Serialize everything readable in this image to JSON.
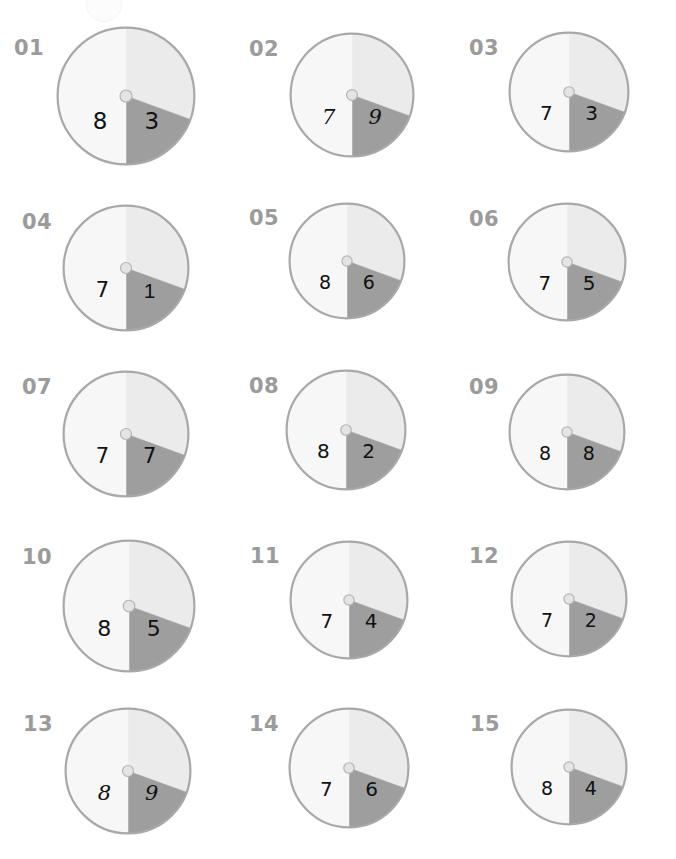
{
  "page": {
    "width": 676,
    "height": 859,
    "background": "#ffffff",
    "columns": 3,
    "rows": 5,
    "chart_count": 15
  },
  "palette": {
    "slice_dark": "#9e9e9e",
    "slice_light": "#ebebeb",
    "slice_white": "#f7f7f7",
    "outline": "#a8a8a8",
    "hub_fill": "#e4e4e4",
    "hub_stroke": "#b4b4b4",
    "index_label": "#9b9b9b",
    "number_label": "#111111"
  },
  "geometry": {
    "note": "Each pie is divided into three wedges by radii at the listed angles, measured in degrees clockwise from 12 o'clock.",
    "boundary_angles_deg": [
      0,
      110,
      180
    ],
    "wedges": [
      {
        "name": "top-light",
        "from_deg": 0,
        "to_deg": 110,
        "fill": "#ebebeb",
        "labeled": false
      },
      {
        "name": "left-dark",
        "from_deg": 110,
        "to_deg": 180,
        "fill": "#9e9e9e",
        "labeled": true
      },
      {
        "name": "right-white",
        "from_deg": 180,
        "to_deg": 360,
        "fill": "#f7f7f7",
        "labeled": true
      }
    ]
  },
  "chart_data": {
    "type": "pie",
    "subtitle": "",
    "xlabel": "",
    "ylabel": "",
    "legend_position": "none",
    "grid": false,
    "series": [
      {
        "name": "left-dark-wedge",
        "values": [
          8,
          7,
          7,
          7,
          8,
          7,
          7,
          8,
          8,
          8,
          7,
          7,
          8,
          7,
          8
        ]
      },
      {
        "name": "right-white-wedge",
        "values": [
          3,
          9,
          3,
          1,
          6,
          5,
          7,
          2,
          8,
          5,
          4,
          2,
          9,
          6,
          4
        ]
      }
    ],
    "categories": [
      "01",
      "02",
      "03",
      "04",
      "05",
      "06",
      "07",
      "08",
      "09",
      "10",
      "11",
      "12",
      "13",
      "14",
      "15"
    ]
  },
  "charts": [
    {
      "index": "01",
      "left": "8",
      "right": "3",
      "left_font": "font-sans",
      "right_font": "font-sans",
      "x": 56,
      "y": 26,
      "size": 140,
      "label_x": 14,
      "label_y": 38,
      "label_size": 21
    },
    {
      "index": "02",
      "left": "7",
      "right": "9",
      "left_font": "font-script",
      "right_font": "font-script",
      "x": 289,
      "y": 32,
      "size": 126,
      "label_x": 249,
      "label_y": 39,
      "label_size": 21
    },
    {
      "index": "03",
      "left": "7",
      "right": "3",
      "left_font": "font-sans",
      "right_font": "font-sans",
      "x": 508,
      "y": 31,
      "size": 122,
      "label_x": 469,
      "label_y": 38,
      "label_size": 21
    },
    {
      "index": "04",
      "left": "7",
      "right": "1",
      "left_font": "font-sans",
      "right_font": "font-narrow",
      "x": 62,
      "y": 204,
      "size": 128,
      "label_x": 22,
      "label_y": 212,
      "label_size": 21
    },
    {
      "index": "05",
      "left": "8",
      "right": "6",
      "left_font": "font-sans",
      "right_font": "font-sans",
      "x": 288,
      "y": 202,
      "size": 118,
      "label_x": 249,
      "label_y": 208,
      "label_size": 21
    },
    {
      "index": "06",
      "left": "7",
      "right": "5",
      "left_font": "font-sans",
      "right_font": "font-sans",
      "x": 507,
      "y": 202,
      "size": 120,
      "label_x": 469,
      "label_y": 209,
      "label_size": 21
    },
    {
      "index": "07",
      "left": "7",
      "right": "7",
      "left_font": "font-sans",
      "right_font": "font-sans",
      "x": 62,
      "y": 370,
      "size": 128,
      "label_x": 22,
      "label_y": 377,
      "label_size": 21
    },
    {
      "index": "08",
      "left": "8",
      "right": "2",
      "left_font": "font-sans",
      "right_font": "font-sans",
      "x": 285,
      "y": 369,
      "size": 122,
      "label_x": 249,
      "label_y": 376,
      "label_size": 21
    },
    {
      "index": "09",
      "left": "8",
      "right": "8",
      "left_font": "font-sans",
      "right_font": "font-sans",
      "x": 508,
      "y": 373,
      "size": 118,
      "label_x": 469,
      "label_y": 377,
      "label_size": 21
    },
    {
      "index": "10",
      "left": "8",
      "right": "5",
      "left_font": "font-sans",
      "right_font": "font-sans",
      "x": 62,
      "y": 539,
      "size": 134,
      "label_x": 22,
      "label_y": 547,
      "label_size": 21
    },
    {
      "index": "11",
      "left": "7",
      "right": "4",
      "left_font": "font-sans",
      "right_font": "font-sans",
      "x": 289,
      "y": 540,
      "size": 120,
      "label_x": 250,
      "label_y": 546,
      "label_size": 21
    },
    {
      "index": "12",
      "left": "7",
      "right": "2",
      "left_font": "font-sans",
      "right_font": "font-sans",
      "x": 510,
      "y": 540,
      "size": 118,
      "label_x": 469,
      "label_y": 546,
      "label_size": 21
    },
    {
      "index": "13",
      "left": "8",
      "right": "9",
      "left_font": "font-script",
      "right_font": "font-script",
      "x": 64,
      "y": 707,
      "size": 128,
      "label_x": 23,
      "label_y": 714,
      "label_size": 21
    },
    {
      "index": "14",
      "left": "7",
      "right": "6",
      "left_font": "font-sans",
      "right_font": "font-sans",
      "x": 288,
      "y": 707,
      "size": 122,
      "label_x": 249,
      "label_y": 714,
      "label_size": 21
    },
    {
      "index": "15",
      "left": "8",
      "right": "4",
      "left_font": "font-sans",
      "right_font": "font-sans",
      "x": 510,
      "y": 708,
      "size": 118,
      "label_x": 470,
      "label_y": 714,
      "label_size": 21
    }
  ],
  "artifact": {
    "x": 86,
    "y": -14,
    "size": 34
  }
}
